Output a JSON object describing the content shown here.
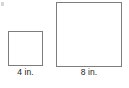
{
  "figure": {
    "type": "geometry-diagram",
    "background_color": "#ffffff",
    "stroke_color": "#7d7d7d",
    "text_color": "#1c1c1c",
    "shapes": [
      {
        "name": "small-square",
        "shape": "square",
        "label": "4 in.",
        "side_value": "4",
        "unit": "in.",
        "fill": "#ffffff",
        "stroke": "#7d7d7d"
      },
      {
        "name": "large-square",
        "shape": "square",
        "label": "8 in.",
        "side_value": "8",
        "unit": "in.",
        "fill": "#ffffff",
        "stroke": "#7d7d7d"
      }
    ],
    "artifact": {
      "name": "scan-speck",
      "color": "#cfcfcf"
    }
  }
}
